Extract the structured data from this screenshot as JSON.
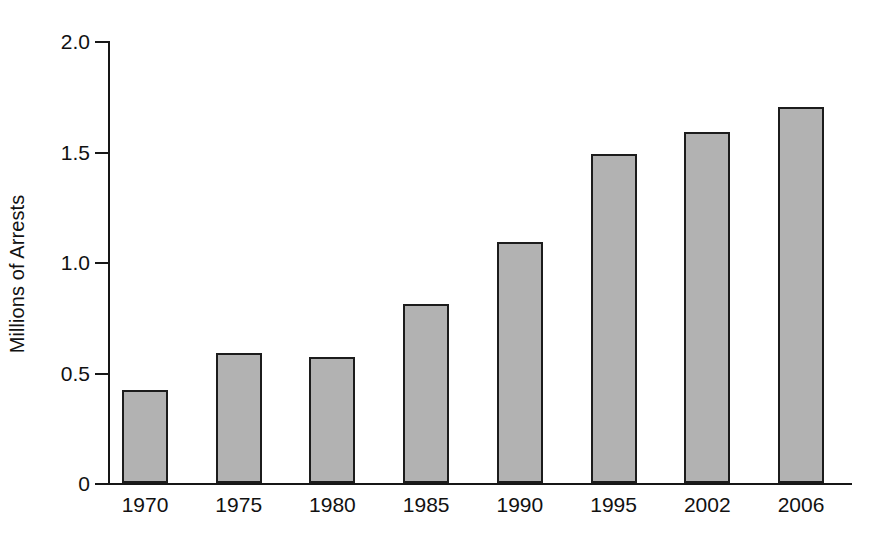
{
  "chart_data": {
    "type": "bar",
    "title": "",
    "subtitle": "",
    "xlabel": "",
    "ylabel": "Millions of Arrests",
    "categories": [
      "1970",
      "1975",
      "1980",
      "1985",
      "1990",
      "1995",
      "2002",
      "2006"
    ],
    "values": [
      0.42,
      0.59,
      0.57,
      0.81,
      1.09,
      1.49,
      1.59,
      1.7
    ],
    "series": [
      {
        "name": "Arrests",
        "values": [
          0.42,
          0.59,
          0.57,
          0.81,
          1.09,
          1.49,
          1.59,
          1.7
        ]
      }
    ],
    "ylim": [
      0,
      2.0
    ],
    "ytick_values": [
      0,
      0.5,
      1.0,
      1.5,
      2.0
    ],
    "ytick_labels": [
      "0",
      "0.5",
      "1.0",
      "1.5",
      "2.0"
    ],
    "grid": false,
    "legend": false,
    "legend_position": "none",
    "bar_fill_color": "#b2b2b2",
    "bar_edge_color": "#1c1c1c",
    "axis_color": "#171717",
    "background_color": "#ffffff",
    "annotations": []
  }
}
